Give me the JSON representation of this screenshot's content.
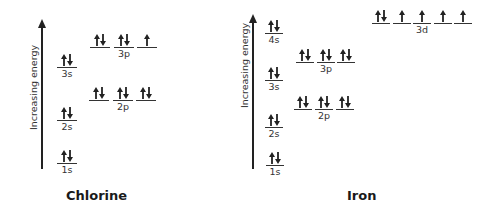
{
  "axis_label": "Increasing energy",
  "chlorine": {
    "title": "Chlorine",
    "sublevels": {
      "1s": {
        "label": "1s",
        "orbitals": [
          "updown"
        ]
      },
      "2s": {
        "label": "2s",
        "orbitals": [
          "updown"
        ]
      },
      "2p": {
        "label": "2p",
        "orbitals": [
          "updown",
          "updown",
          "updown"
        ]
      },
      "3s": {
        "label": "3s",
        "orbitals": [
          "updown"
        ]
      },
      "3p": {
        "label": "3p",
        "orbitals": [
          "updown",
          "updown",
          "up"
        ]
      }
    }
  },
  "iron": {
    "title": "Iron",
    "sublevels": {
      "1s": {
        "label": "1s",
        "orbitals": [
          "updown"
        ]
      },
      "2s": {
        "label": "2s",
        "orbitals": [
          "updown"
        ]
      },
      "2p": {
        "label": "2p",
        "orbitals": [
          "updown",
          "updown",
          "updown"
        ]
      },
      "3s": {
        "label": "3s",
        "orbitals": [
          "updown"
        ]
      },
      "3p": {
        "label": "3p",
        "orbitals": [
          "updown",
          "updown",
          "updown"
        ]
      },
      "4s": {
        "label": "4s",
        "orbitals": [
          "updown"
        ]
      },
      "3d": {
        "label": "3d",
        "orbitals": [
          "updown",
          "up",
          "up",
          "up",
          "up"
        ]
      }
    }
  },
  "colors": {
    "ink": "#222222",
    "background": "#ffffff"
  }
}
